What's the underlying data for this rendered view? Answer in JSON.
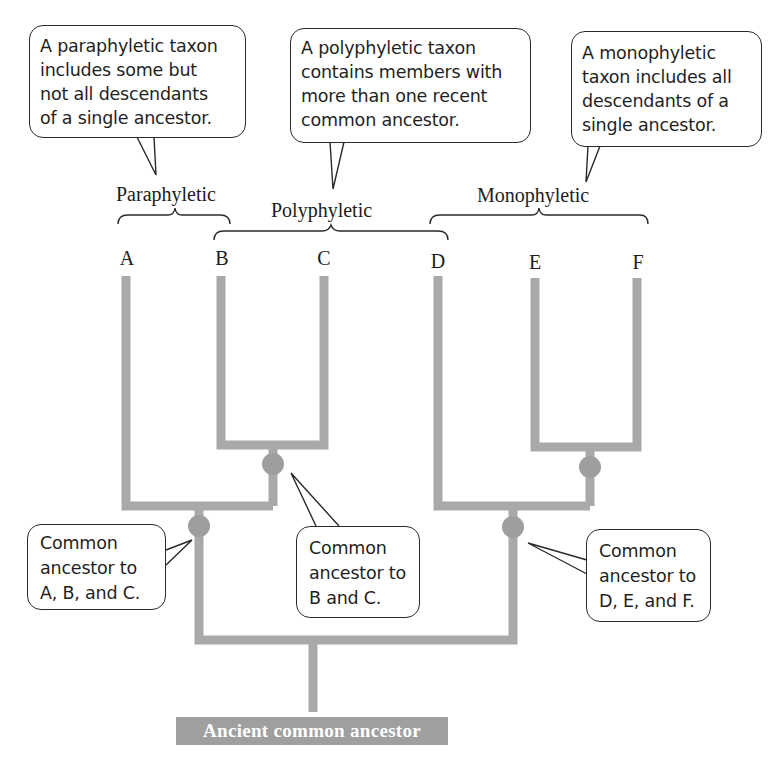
{
  "callouts": {
    "paraphyletic": "A paraphyletic taxon\nincludes some but\nnot all descendants\nof a single ancestor.",
    "polyphyletic": "A polyphyletic taxon\ncontains members with\nmore than one recent\ncommon ancestor.",
    "monophyletic": "A monophyletic\ntaxon includes all\ndescendants of a\nsingle ancestor."
  },
  "groups": {
    "paraphyletic": "Paraphyletic",
    "polyphyletic": "Polyphyletic",
    "monophyletic": "Monophyletic"
  },
  "taxa": [
    "A",
    "B",
    "C",
    "D",
    "E",
    "F"
  ],
  "nodes": {
    "abc": "Common\nancestor to\nA, B, and C.",
    "bc": "Common\nancestor to\nB and C.",
    "def": "Common\nancestor to\nD, E, and F."
  },
  "root": {
    "label": "Ancient common ancestor"
  },
  "colors": {
    "branch": "#a9a9a9",
    "node": "#9e9e9e",
    "root_box": "#9f9f9f",
    "outline": "#2a2a2a"
  }
}
